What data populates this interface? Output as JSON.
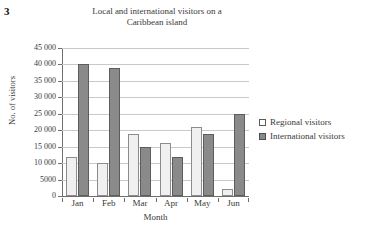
{
  "question_number": "3",
  "chart_data": {
    "type": "bar",
    "title": "Local and international visitors on a Caribbean island",
    "title_lines": [
      "Local and international visitors on a",
      "Caribbean island"
    ],
    "xlabel": "Month",
    "ylabel": "No. of visitors",
    "categories": [
      "Jan",
      "Feb",
      "Mar",
      "Apr",
      "May",
      "Jun"
    ],
    "series": [
      {
        "name": "Regional visitors",
        "color": "#f0f0f0",
        "values": [
          12000,
          10000,
          19000,
          16000,
          21000,
          2000
        ]
      },
      {
        "name": "International visitors",
        "color": "#8a8a8a",
        "values": [
          40000,
          39000,
          15000,
          12000,
          19000,
          25000
        ]
      }
    ],
    "ylim": [
      0,
      45000
    ],
    "ytick_values": [
      45000,
      40000,
      35000,
      30000,
      25000,
      20000,
      15000,
      10000,
      5000,
      0
    ],
    "ytick_labels": [
      "45 000",
      "40 000",
      "35 000",
      "30 000",
      "25 000",
      "20 000",
      "15 000",
      "10 000",
      "5000",
      "0"
    ],
    "grid": true,
    "legend_position": "right"
  },
  "legend": {
    "items": [
      {
        "label": "Regional visitors",
        "swatch": "regional"
      },
      {
        "label": "International visitors",
        "swatch": "international"
      }
    ]
  }
}
